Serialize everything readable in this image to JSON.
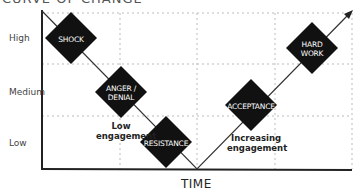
{
  "diagram": {
    "title": "CURVE OF CHANGE",
    "x_axis": {
      "label": "TIME"
    },
    "y_axis": {
      "levels": [
        "High",
        "Medium",
        "Low"
      ]
    },
    "stages": [
      {
        "label_line1": "SHOCK",
        "label_line2": ""
      },
      {
        "label_line1": "ANGER /",
        "label_line2": "DENIAL"
      },
      {
        "label_line1": "RESISTANCE",
        "label_line2": ""
      },
      {
        "label_line1": "ACCEPTANCE",
        "label_line2": ""
      },
      {
        "label_line1": "HARD",
        "label_line2": "WORK"
      }
    ],
    "annotations": [
      {
        "line1": "Low",
        "line2": "engagement"
      },
      {
        "line1": "Increasing",
        "line2": "engagement"
      }
    ],
    "colors": {
      "diamond": "#111111",
      "line": "#333333",
      "grid": "#bbbbbb",
      "axis": "#222222"
    }
  }
}
